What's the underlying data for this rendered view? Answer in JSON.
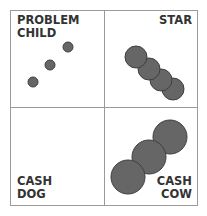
{
  "quadrants": {
    "top_left": {
      "line1": "PROBLEM",
      "line2": "CHILD"
    },
    "top_right": {
      "line1": "STAR"
    },
    "bottom_left": {
      "line1": "CASH",
      "line2": "DOG"
    },
    "bottom_right": {
      "line1": "CASH",
      "line2": "COW"
    }
  },
  "colors": {
    "border": "#9a9a9a",
    "circle_fill": "#666666",
    "circle_stroke": "#3f3f3f",
    "text": "#333333"
  }
}
